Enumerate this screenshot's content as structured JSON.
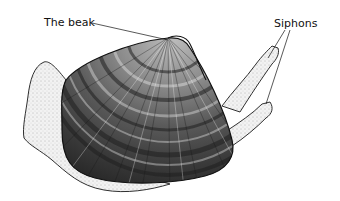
{
  "diagram": {
    "labels": {
      "beak": "The beak",
      "siphons": "Siphons"
    },
    "colors": {
      "ink": "#1a1a1a",
      "shell_dark": "#2e2e2e",
      "shell_mid": "#7a7a7a",
      "shell_light": "#d8d8d8",
      "foot_fill": "#eeeeee",
      "background": "#ffffff"
    }
  }
}
